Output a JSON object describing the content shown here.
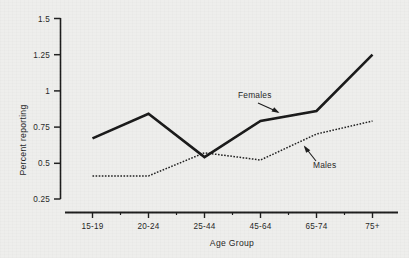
{
  "chart_data": {
    "type": "line",
    "title": "",
    "xlabel": "Age Group",
    "ylabel": "Percent reporting",
    "categories": [
      "15-19",
      "20-24",
      "25-44",
      "45-64",
      "65-74",
      "75+"
    ],
    "ylim": [
      0.25,
      1.5
    ],
    "yticks": [
      "0.25",
      "0.5",
      "0.75",
      "1",
      "1.25",
      "1.5"
    ],
    "ytick_values": [
      0.25,
      0.5,
      0.75,
      1.0,
      1.25,
      1.5
    ],
    "grid": false,
    "legend_position": "inline-annotations",
    "series": [
      {
        "name": "Females",
        "style": "solid-thick",
        "color": "#151515",
        "values": [
          0.67,
          0.84,
          0.54,
          0.79,
          0.86,
          1.25
        ]
      },
      {
        "name": "Males",
        "style": "dotted-thin",
        "color": "#1d1d1d",
        "values": [
          0.41,
          0.41,
          0.57,
          0.52,
          0.7,
          0.79
        ]
      }
    ],
    "annotations": [
      {
        "text": "Females",
        "points_to_series": "Females"
      },
      {
        "text": "Males",
        "points_to_series": "Males"
      }
    ]
  },
  "axes": {
    "y_label": "Percent reporting",
    "x_label": "Age Group"
  }
}
